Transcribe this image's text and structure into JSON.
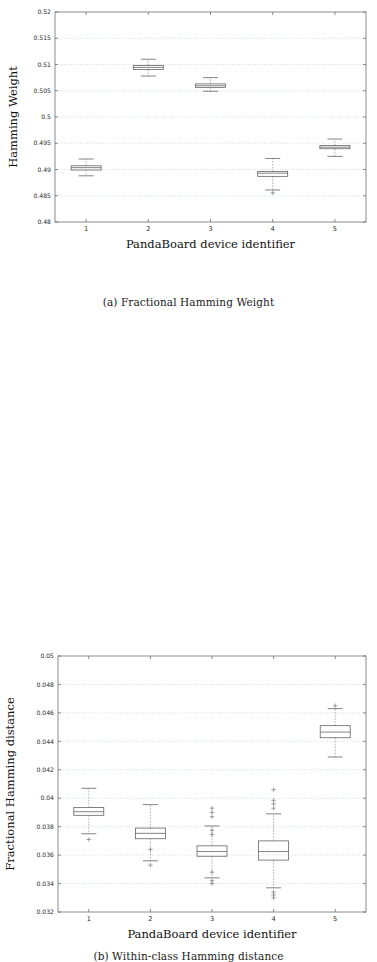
{
  "figures": [
    {
      "id": "a",
      "caption": "(a) Fractional Hamming Weight",
      "chart_data": {
        "type": "box",
        "title": "",
        "xlabel": "PandaBoard device identifier",
        "ylabel": "Hamming Weight",
        "categories": [
          "1",
          "2",
          "3",
          "4",
          "5"
        ],
        "xticklabels": [
          "1",
          "2",
          "3",
          "4",
          "5"
        ],
        "yticklabels": [
          "0.48",
          "0.485",
          "0.49",
          "0.495",
          "0.5",
          "0.505",
          "0.51",
          "0.515",
          "0.52"
        ],
        "ylim": [
          0.48,
          0.52
        ],
        "ytick_step": 0.005,
        "grid": true,
        "legend": "none",
        "boxes": [
          {
            "category": "1",
            "whisker_low": 0.4888,
            "q1": 0.4899,
            "median": 0.49035,
            "q3": 0.4907,
            "whisker_high": 0.492,
            "outliers": []
          },
          {
            "category": "2",
            "whisker_low": 0.5078,
            "q1": 0.50905,
            "median": 0.50945,
            "q3": 0.5098,
            "whisker_high": 0.511,
            "outliers": []
          },
          {
            "category": "3",
            "whisker_low": 0.5049,
            "q1": 0.50565,
            "median": 0.50595,
            "q3": 0.5063,
            "whisker_high": 0.5075,
            "outliers": []
          },
          {
            "category": "4",
            "whisker_low": 0.4861,
            "q1": 0.4887,
            "median": 0.4893,
            "q3": 0.4896,
            "whisker_high": 0.4921,
            "outliers": [
              0.48555
            ]
          },
          {
            "category": "5",
            "whisker_low": 0.4925,
            "q1": 0.49395,
            "median": 0.49425,
            "q3": 0.49455,
            "whisker_high": 0.4958,
            "outliers": []
          }
        ]
      }
    },
    {
      "id": "b",
      "caption": "(b) Within-class Hamming distance",
      "chart_data": {
        "type": "box",
        "title": "",
        "xlabel": "PandaBoard device identifier",
        "ylabel": "Fractional Hamming distance",
        "categories": [
          "1",
          "2",
          "3",
          "4",
          "5"
        ],
        "xticklabels": [
          "1",
          "2",
          "3",
          "4",
          "5"
        ],
        "yticklabels": [
          "0.032",
          "0.034",
          "0.036",
          "0.038",
          "0.04",
          "0.042",
          "0.044",
          "0.046",
          "0.048",
          "0.05"
        ],
        "ylim": [
          0.032,
          0.05
        ],
        "ytick_step": 0.002,
        "grid": true,
        "legend": "none",
        "boxes": [
          {
            "category": "1",
            "whisker_low": 0.0375,
            "q1": 0.0388,
            "median": 0.03905,
            "q3": 0.03935,
            "whisker_high": 0.0407,
            "outliers": [
              0.0371
            ]
          },
          {
            "category": "2",
            "whisker_low": 0.0356,
            "q1": 0.03715,
            "median": 0.03753,
            "q3": 0.0379,
            "whisker_high": 0.03955,
            "outliers": [
              0.0364,
              0.0353
            ]
          },
          {
            "category": "3",
            "whisker_low": 0.0344,
            "q1": 0.03592,
            "median": 0.03625,
            "q3": 0.03665,
            "whisker_high": 0.03805,
            "outliers": [
              0.0387,
              0.039,
              0.0393,
              0.03775,
              0.03745,
              0.0348,
              0.0342,
              0.034
            ]
          },
          {
            "category": "4",
            "whisker_low": 0.0337,
            "q1": 0.03565,
            "median": 0.03625,
            "q3": 0.037,
            "whisker_high": 0.0389,
            "outliers": [
              0.0406,
              0.03985,
              0.0396,
              0.0393,
              0.0334,
              0.0332,
              0.033
            ]
          },
          {
            "category": "5",
            "whisker_low": 0.0429,
            "q1": 0.04425,
            "median": 0.04465,
            "q3": 0.0451,
            "whisker_high": 0.0463,
            "outliers": [
              0.0465
            ]
          }
        ]
      }
    }
  ]
}
